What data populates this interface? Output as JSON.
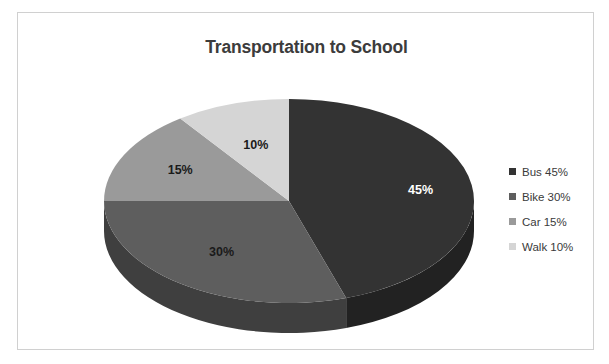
{
  "frame": {
    "border_color": "#d0d0d0",
    "background": "#ffffff"
  },
  "chart_data": {
    "type": "pie",
    "title": "Transportation to School",
    "xlabel": "",
    "ylabel": "",
    "three_d": true,
    "start_angle_deg": 0,
    "direction": "clockwise",
    "legend_position": "right",
    "categories": [
      "Bus",
      "Bike",
      "Car",
      "Walk"
    ],
    "values": [
      45,
      30,
      15,
      10
    ],
    "value_unit": "%",
    "data_labels": [
      "45%",
      "30%",
      "15%",
      "10%"
    ],
    "data_label_colors": [
      "#ffffff",
      "#1a1a1a",
      "#1a1a1a",
      "#1a1a1a"
    ],
    "slice_colors": [
      "#333333",
      "#5e5e5e",
      "#9a9a9a",
      "#d5d5d5"
    ],
    "slice_side_colors": [
      "#222222",
      "#3f3f3f",
      "#6a6a6a",
      "#949494"
    ],
    "legend_entries": [
      {
        "label": "Bus 45%",
        "color": "#333333"
      },
      {
        "label": "Bike 30%",
        "color": "#5e5e5e"
      },
      {
        "label": "Car 15%",
        "color": "#9a9a9a"
      },
      {
        "label": "Walk 10%",
        "color": "#d5d5d5"
      }
    ],
    "geometry": {
      "cx": 211,
      "cy": 128,
      "rx": 185,
      "ry": 102,
      "depth": 30
    }
  }
}
